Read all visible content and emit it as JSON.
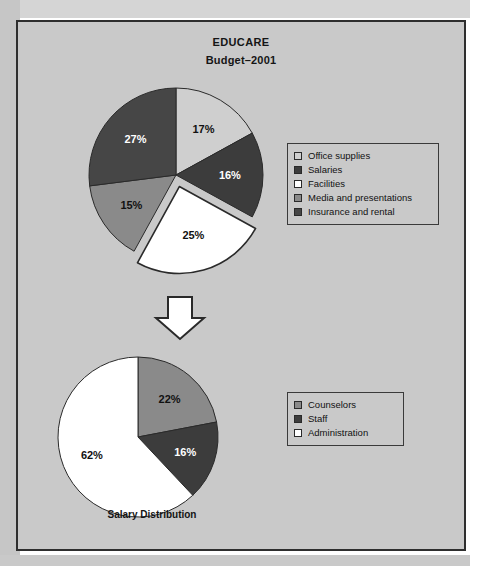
{
  "figure": {
    "title": "EDUCARE",
    "subtitle": "Budget–2001",
    "caption": "Salary Distribution",
    "arrow_icon": "down-arrow-icon",
    "frame_color": "#2e2e2e",
    "background_color": "#c9c9c9"
  },
  "colors": {
    "light_gray": "#cfcfcf",
    "dark_gray": "#3c3c3c",
    "white": "#ffffff",
    "medium_gray": "#8a8a8a",
    "very_dark": "#464646",
    "outline": "#2a2a2a"
  },
  "legend_top": {
    "items": [
      {
        "label": "Office supplies",
        "color": "#cfcfcf"
      },
      {
        "label": "Salaries",
        "color": "#3c3c3c"
      },
      {
        "label": "Facilities",
        "color": "#ffffff"
      },
      {
        "label": "Media and presentations",
        "color": "#8a8a8a"
      },
      {
        "label": "Insurance and rental",
        "color": "#464646"
      }
    ]
  },
  "legend_bottom": {
    "items": [
      {
        "label": "Counselors",
        "color": "#8a8a8a"
      },
      {
        "label": "Staff",
        "color": "#3c3c3c"
      },
      {
        "label": "Administration",
        "color": "#ffffff"
      }
    ]
  },
  "chart_data": [
    {
      "type": "pie",
      "title": "EDUCARE Budget–2001",
      "id": "budget-pie",
      "categories": [
        "Office supplies",
        "Salaries",
        "Facilities",
        "Media and presentations",
        "Insurance and rental"
      ],
      "values": [
        17,
        16,
        25,
        15,
        27
      ],
      "labels": [
        "17%",
        "16%",
        "25%",
        "15%",
        "27%"
      ],
      "colors": [
        "#cfcfcf",
        "#3c3c3c",
        "#ffffff",
        "#8a8a8a",
        "#464646"
      ],
      "label_colors": [
        "#111111",
        "#ffffff",
        "#111111",
        "#111111",
        "#ffffff"
      ],
      "exploded": [
        "Facilities"
      ],
      "units": "percent",
      "legend_position": "right"
    },
    {
      "type": "pie",
      "title": "Salary Distribution",
      "id": "salary-pie",
      "categories": [
        "Counselors",
        "Staff",
        "Administration"
      ],
      "values": [
        22,
        16,
        62
      ],
      "labels": [
        "22%",
        "16%",
        "62%"
      ],
      "colors": [
        "#8a8a8a",
        "#3c3c3c",
        "#ffffff"
      ],
      "label_colors": [
        "#111111",
        "#ffffff",
        "#111111"
      ],
      "exploded": [],
      "units": "percent",
      "legend_position": "right"
    }
  ]
}
